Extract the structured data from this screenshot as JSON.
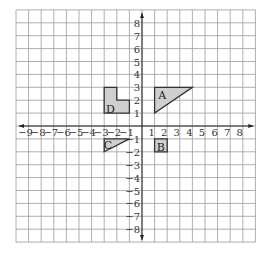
{
  "figure": {
    "type": "coordinate-grid",
    "x_range": [
      -10,
      9
    ],
    "y_range": [
      -9,
      9
    ],
    "x_tick_labels": [
      "−9",
      "−8",
      "−7",
      "−6",
      "−5",
      "−4",
      "−3",
      "−2",
      "−1",
      "1",
      "2",
      "3",
      "4",
      "5",
      "6",
      "7",
      "8"
    ],
    "x_tick_values": [
      -9,
      -8,
      -7,
      -6,
      -5,
      -4,
      -3,
      -2,
      -1,
      1,
      2,
      3,
      4,
      5,
      6,
      7,
      8
    ],
    "y_tick_labels": [
      "8",
      "7",
      "6",
      "5",
      "4",
      "3",
      "2",
      "1",
      "−1",
      "−2",
      "−3",
      "−4",
      "−5",
      "−6",
      "−7",
      "−8"
    ],
    "y_tick_values": [
      8,
      7,
      6,
      5,
      4,
      3,
      2,
      1,
      -1,
      -2,
      -3,
      -4,
      -5,
      -6,
      -7,
      -8
    ],
    "shape_fill": "#cfcfcf",
    "shape_stroke": "#333333",
    "grid_color": "#9a9a9a"
  },
  "shapes": [
    {
      "label": "A",
      "vertices": [
        [
          1,
          1
        ],
        [
          1,
          3
        ],
        [
          4,
          3
        ]
      ],
      "label_pos": [
        1.6,
        2.4
      ]
    },
    {
      "label": "B",
      "vertices": [
        [
          1,
          -1
        ],
        [
          2,
          -1
        ],
        [
          2,
          -2
        ],
        [
          1,
          -2
        ]
      ],
      "label_pos": [
        1.5,
        -1.6
      ]
    },
    {
      "label": "C",
      "vertices": [
        [
          -3,
          -1
        ],
        [
          -1,
          -1
        ],
        [
          -3,
          -2
        ]
      ],
      "label_pos": [
        -2.7,
        -1.45
      ]
    },
    {
      "label": "D",
      "vertices": [
        [
          -3,
          3
        ],
        [
          -2,
          3
        ],
        [
          -2,
          2
        ],
        [
          -1,
          2
        ],
        [
          -1,
          1
        ],
        [
          -3,
          1
        ]
      ],
      "label_pos": [
        -2.5,
        1.35
      ]
    }
  ]
}
